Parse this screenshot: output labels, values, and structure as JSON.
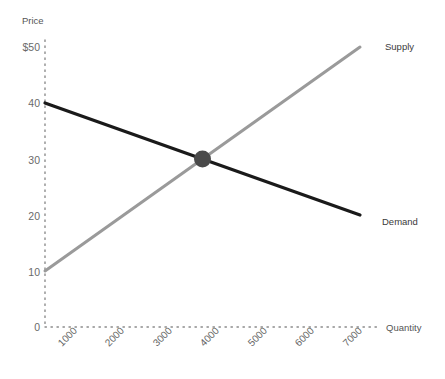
{
  "chart_data": {
    "type": "line",
    "title": "",
    "xlabel": "Quantity",
    "ylabel": "Price",
    "xlim": [
      0,
      7500
    ],
    "ylim": [
      0,
      50
    ],
    "grid": false,
    "legend_position": "line-end-labels",
    "x_ticks": [
      {
        "value": 1000,
        "label": "1000"
      },
      {
        "value": 2000,
        "label": "2000"
      },
      {
        "value": 3000,
        "label": "3000"
      },
      {
        "value": 4000,
        "label": "4000"
      },
      {
        "value": 5000,
        "label": "5000"
      },
      {
        "value": 6000,
        "label": "6000"
      },
      {
        "value": 7000,
        "label": "7000"
      }
    ],
    "y_ticks": [
      {
        "value": 0,
        "label": "0"
      },
      {
        "value": 10,
        "label": "10"
      },
      {
        "value": 20,
        "label": "20"
      },
      {
        "value": 30,
        "label": "30"
      },
      {
        "value": 40,
        "label": "40"
      },
      {
        "value": 50,
        "label": "$50"
      }
    ],
    "series": [
      {
        "name": "Demand",
        "color": "#1a1a1a",
        "points": [
          [
            0,
            40
          ],
          [
            7000,
            20
          ]
        ]
      },
      {
        "name": "Supply",
        "color": "#9a9a9a",
        "points": [
          [
            0,
            10
          ],
          [
            7000,
            50
          ]
        ]
      }
    ],
    "annotations": [
      {
        "name": "equilibrium-point",
        "x": 3500,
        "y": 30,
        "color": "#4a4a4a"
      }
    ]
  },
  "labels": {
    "y_axis_title": "Price",
    "x_axis_title": "Quantity",
    "demand": "Demand",
    "supply": "Supply",
    "y_tick_50": "$50",
    "y_tick_40": "40",
    "y_tick_30": "30",
    "y_tick_20": "20",
    "y_tick_10": "10",
    "y_tick_0": "0",
    "x_tick_1000": "1000",
    "x_tick_2000": "2000",
    "x_tick_3000": "3000",
    "x_tick_4000": "4000",
    "x_tick_5000": "5000",
    "x_tick_6000": "6000",
    "x_tick_7000": "7000"
  },
  "colors": {
    "demand_line": "#1a1a1a",
    "supply_line": "#9a9a9a",
    "equilibrium_dot": "#4a4a4a",
    "axis_dots": "#8c8c8c",
    "background": "#ffffff",
    "tick_text": "#6a6a6a"
  }
}
